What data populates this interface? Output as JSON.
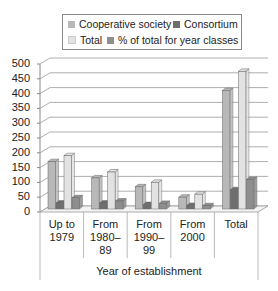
{
  "chart_data": {
    "type": "bar",
    "title": "",
    "xlabel": "Year of establishment",
    "ylabel": "",
    "ylim": [
      0,
      500
    ],
    "yticks": [
      0,
      50,
      100,
      150,
      200,
      250,
      300,
      350,
      400,
      450,
      500
    ],
    "grid": true,
    "legend_position": "top",
    "categories": [
      "Up to 1979",
      "From 1980–89",
      "From 1990–99",
      "From 2000",
      "Total"
    ],
    "category_lines": [
      [
        "Up to",
        "1979"
      ],
      [
        "From",
        "1980–",
        "89"
      ],
      [
        "From",
        "1990–",
        "99"
      ],
      [
        "From",
        "2000"
      ],
      [
        "Total"
      ]
    ],
    "series": [
      {
        "name": "Cooperative society",
        "color": "#b8b8b8",
        "values": [
          160,
          105,
          75,
          40,
          400
        ]
      },
      {
        "name": "Consortium",
        "color": "#6e6e6e",
        "values": [
          20,
          20,
          15,
          12,
          65
        ]
      },
      {
        "name": "Total",
        "color": "#e2e2e2",
        "values": [
          180,
          125,
          90,
          50,
          465
        ]
      },
      {
        "name": "% of total for year classes",
        "color": "#8e8e8e",
        "values": [
          38,
          27,
          19,
          11,
          100
        ]
      }
    ]
  },
  "legend": {
    "items": [
      {
        "label": "Cooperative society",
        "color": "#b8b8b8"
      },
      {
        "label": "Consortium",
        "color": "#6e6e6e"
      },
      {
        "label": "Total",
        "color": "#e2e2e2"
      },
      {
        "label": "% of total for year classes",
        "color": "#8e8e8e"
      }
    ]
  }
}
